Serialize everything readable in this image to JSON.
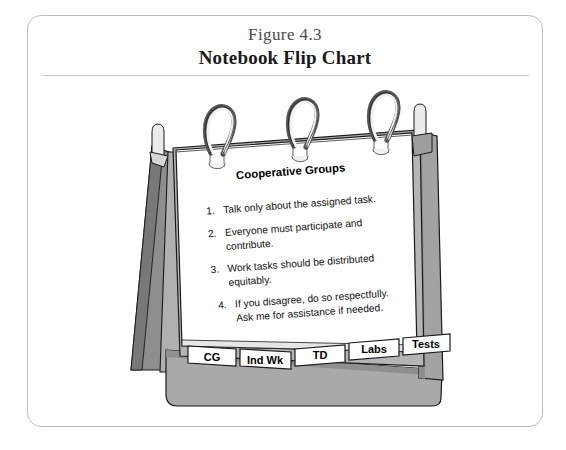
{
  "figure": {
    "number": "Figure 4.3",
    "title": "Notebook Flip Chart"
  },
  "flipchart": {
    "page_heading": "Cooperative Groups",
    "rules": [
      {
        "number": "1.",
        "lines": [
          "Talk only about the assigned task."
        ]
      },
      {
        "number": "2.",
        "lines": [
          "Everyone must participate and",
          "contribute."
        ]
      },
      {
        "number": "3.",
        "lines": [
          "Work tasks should be distributed",
          "equitably."
        ]
      },
      {
        "number": "4.",
        "lines": [
          "If you disagree, do so respectfully.",
          "Ask me for assistance if needed."
        ]
      }
    ],
    "tabs": [
      {
        "label": "CG"
      },
      {
        "label": "Ind Wk"
      },
      {
        "label": "TD"
      },
      {
        "label": "Labs"
      },
      {
        "label": "Tests"
      }
    ],
    "rings_count": 3,
    "colors": {
      "page": "#ffffff",
      "easel_front": "#a9a9a9",
      "easel_shadow": "#8a8a8a",
      "easel_dark": "#777777",
      "outline": "#1a1a1a",
      "ring_light": "#f2f2f2",
      "ring_dark": "#555555",
      "frame_border": "#bdbdbd"
    }
  }
}
